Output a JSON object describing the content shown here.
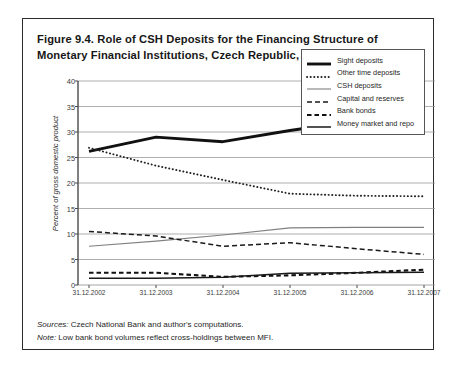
{
  "figure": {
    "caption": "Figure 9.4. Role of CSH Deposits for the Financing Structure of Monetary Financial Institutions, Czech Republic, 2002–07",
    "sources_lead": "Sources:",
    "sources_text": " Czech National Bank and author's computations.",
    "note_lead": "Note:",
    "note_text": " Low bank bond volumes reflect cross-holdings between MFI."
  },
  "chart_data": {
    "type": "line",
    "title": "Figure 9.4. Role of CSH Deposits for the Financing Structure of Monetary Financial Institutions, Czech Republic, 2002–07",
    "xlabel": "",
    "ylabel": "Percent of gross domestic product",
    "categories": [
      "31.12.2002",
      "31.12.2003",
      "31.12.2004",
      "31.12.2005",
      "31.12.2006",
      "31.12.2007"
    ],
    "x": [
      2002,
      2003,
      2004,
      2005,
      2006,
      2007
    ],
    "ylim": [
      0,
      40
    ],
    "yticks": [
      0,
      5,
      10,
      15,
      20,
      25,
      30,
      35,
      40
    ],
    "grid": true,
    "legend_position": "top-right",
    "series": [
      {
        "name": "Sight deposits",
        "style": "solid-thick",
        "color": "#111111",
        "values": [
          26.2,
          29.0,
          28.1,
          30.3,
          32.2,
          34.0
        ]
      },
      {
        "name": "Other time deposits",
        "style": "dotted",
        "color": "#222222",
        "values": [
          26.9,
          23.4,
          20.6,
          17.9,
          17.5,
          17.4
        ]
      },
      {
        "name": "CSH deposits",
        "style": "solid-thin",
        "color": "#808080",
        "values": [
          7.6,
          8.6,
          9.8,
          11.2,
          11.3,
          11.3
        ]
      },
      {
        "name": "Capital and reserves",
        "style": "dashed",
        "color": "#1a1a1a",
        "values": [
          10.5,
          9.6,
          7.6,
          8.3,
          7.1,
          6.0
        ]
      },
      {
        "name": "Bank bonds",
        "style": "dashed-bold",
        "color": "#111111",
        "values": [
          2.4,
          2.4,
          1.6,
          1.9,
          2.4,
          3.0
        ]
      },
      {
        "name": "Money market and repo",
        "style": "solid-medium",
        "color": "#1a1a1a",
        "values": [
          1.3,
          1.3,
          1.5,
          2.3,
          2.4,
          2.5
        ]
      }
    ]
  }
}
